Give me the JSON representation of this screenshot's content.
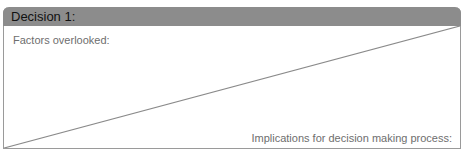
{
  "card": {
    "title": "Decision 1:",
    "top_left_label": "Factors overlooked:",
    "bottom_right_label": "Implications for decision making process:"
  },
  "colors": {
    "header_bg": "#8c8c8c",
    "border": "#9a9a9a",
    "label_text": "#6e6e6e",
    "title_text": "#111111"
  }
}
